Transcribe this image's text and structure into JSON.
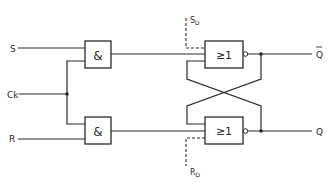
{
  "diagram": {
    "type": "logic-circuit",
    "inputs": {
      "s": "S",
      "ck": "Ck",
      "r": "R",
      "sd": "S",
      "sd_sub": "D",
      "rd": "R",
      "rd_sub": "D"
    },
    "outputs": {
      "q_bar": "Q",
      "q": "Q"
    },
    "gates": {
      "and_top": "&",
      "and_bottom": "&",
      "nor_top": "≥1",
      "nor_bottom": "≥1"
    },
    "colors": {
      "line": "#2a2a2a",
      "background": "#ffffff"
    }
  }
}
